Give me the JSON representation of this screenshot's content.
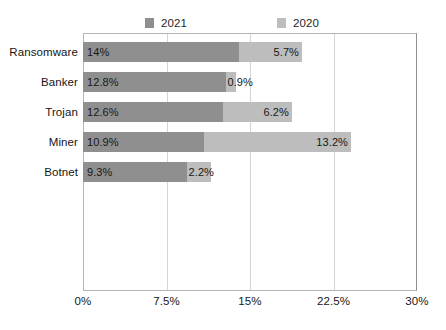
{
  "chart_data": {
    "type": "bar",
    "orientation": "horizontal",
    "stacked": true,
    "title": "",
    "xlabel": "",
    "ylabel": "",
    "categories": [
      "Ransomware",
      "Banker",
      "Trojan",
      "Miner",
      "Botnet"
    ],
    "series": [
      {
        "name": "2021",
        "color": "#8f8f8f",
        "values": [
          14.0,
          12.8,
          12.6,
          10.9,
          9.3
        ],
        "labels": [
          "14%",
          "12.8%",
          "12.6%",
          "10.9%",
          "9.3%"
        ]
      },
      {
        "name": "2020",
        "color": "#bdbdbd",
        "values": [
          5.7,
          0.9,
          6.2,
          13.2,
          2.2
        ],
        "labels": [
          "5.7%",
          "0.9%",
          "6.2%",
          "13.2%",
          "2.2%"
        ]
      }
    ],
    "xlim": [
      0,
      30
    ],
    "xticks": [
      0,
      7.5,
      15,
      22.5,
      30
    ],
    "xtick_labels": [
      "0%",
      "7.5%",
      "15%",
      "22.5%",
      "30%"
    ],
    "grid": true,
    "legend_position": "top",
    "legend": [
      "2021",
      "2020"
    ]
  },
  "colors": {
    "series_2021": "#8f8f8f",
    "series_2020": "#bdbdbd",
    "gridline": "#d5d5d5",
    "frame": "#b5b5b5",
    "text": "#171717",
    "background": "#ffffff"
  }
}
